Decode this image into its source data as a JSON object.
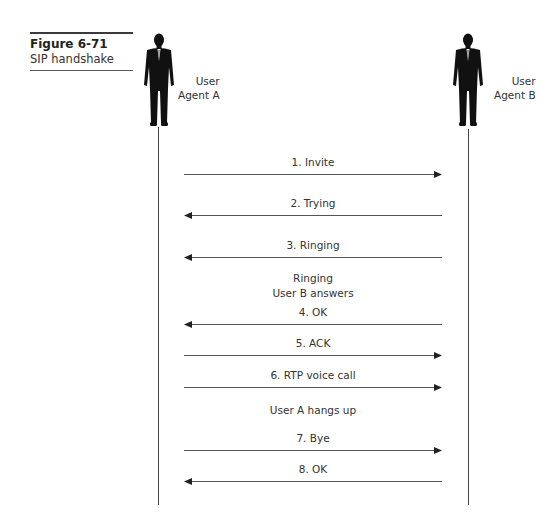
{
  "figure": {
    "number": "Figure 6-71",
    "title": "SIP handshake"
  },
  "agents": [
    {
      "line1": "User",
      "line2": "Agent A",
      "icon": "person-silhouette-icon"
    },
    {
      "line1": "User",
      "line2": "Agent B",
      "icon": "person-silhouette-icon"
    }
  ],
  "messages": [
    {
      "label": "1. Invite",
      "direction": "A_to_B",
      "y": 174
    },
    {
      "label": "2. Trying",
      "direction": "B_to_A",
      "y": 215
    },
    {
      "label": "3. Ringing",
      "direction": "B_to_A",
      "y": 257
    },
    {
      "label": "4. OK",
      "direction": "B_to_A",
      "y": 324
    },
    {
      "label": "5. ACK",
      "direction": "A_to_B",
      "y": 355
    },
    {
      "label": "6. RTP voice call",
      "direction": "A_to_B",
      "y": 387
    },
    {
      "label": "7. Bye",
      "direction": "A_to_B",
      "y": 450
    },
    {
      "label": "8. OK",
      "direction": "B_to_A",
      "y": 481
    }
  ],
  "notes": [
    {
      "line1": "Ringing",
      "line2": "User B answers"
    },
    {
      "line1": "User A hangs up"
    }
  ],
  "colors": {
    "line": "#444444",
    "text": "#333333"
  }
}
